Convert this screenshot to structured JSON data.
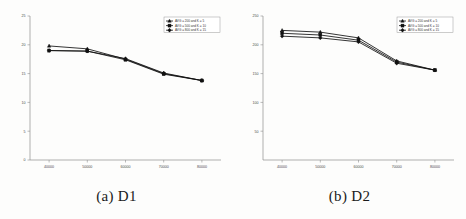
{
  "figure": {
    "panels": [
      {
        "caption": "(a) D1",
        "chart_index": 0
      },
      {
        "caption": "(b) D2",
        "chart_index": 1
      }
    ]
  },
  "chart_data": [
    {
      "type": "line",
      "title": "",
      "subtitle": "",
      "xlabel": "",
      "ylabel": "",
      "x": [
        40000,
        50000,
        60000,
        70000,
        80000
      ],
      "xtick_labels": [
        "40000",
        "50000",
        "60000",
        "70000",
        "80000"
      ],
      "ytick_labels": [
        "0",
        "5",
        "10",
        "15",
        "20",
        "25"
      ],
      "yticks": [
        0,
        5,
        10,
        15,
        20,
        25
      ],
      "xlim": [
        35000,
        85000
      ],
      "ylim": [
        0,
        25
      ],
      "grid": false,
      "legend_position": "top-right",
      "series": [
        {
          "name": "AVG = 200 and K = 5",
          "marker": "triangle",
          "color": "#111111",
          "values": [
            19.8,
            19.3,
            17.5,
            15.0,
            13.8
          ]
        },
        {
          "name": "AVG = 500 and K = 10",
          "marker": "square",
          "color": "#111111",
          "values": [
            19.0,
            18.9,
            17.4,
            14.9,
            13.8
          ]
        },
        {
          "name": "AVG = 800 and K = 15",
          "marker": "diamond",
          "color": "#111111",
          "values": [
            19.0,
            18.9,
            17.6,
            15.1,
            13.8
          ]
        }
      ]
    },
    {
      "type": "line",
      "title": "",
      "subtitle": "",
      "xlabel": "",
      "ylabel": "",
      "x": [
        40000,
        50000,
        60000,
        70000,
        80000
      ],
      "xtick_labels": [
        "40000",
        "50000",
        "60000",
        "70000",
        "80000"
      ],
      "ytick_labels": [
        "50",
        "100",
        "150",
        "200",
        "250"
      ],
      "yticks": [
        50,
        100,
        150,
        200,
        250
      ],
      "xlim": [
        35000,
        85000
      ],
      "ylim": [
        0,
        250
      ],
      "grid": false,
      "legend_position": "top-right",
      "series": [
        {
          "name": "AVG = 200 and K = 5",
          "marker": "triangle",
          "color": "#111111",
          "values": [
            225,
            222,
            212,
            172,
            156
          ]
        },
        {
          "name": "AVG = 500 and K = 10",
          "marker": "square",
          "color": "#111111",
          "values": [
            220,
            217,
            208,
            170,
            156
          ]
        },
        {
          "name": "AVG = 800 and K = 15",
          "marker": "diamond",
          "color": "#111111",
          "values": [
            215,
            212,
            205,
            168,
            156
          ]
        }
      ]
    }
  ]
}
